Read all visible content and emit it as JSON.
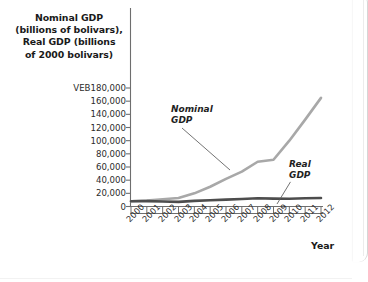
{
  "figure": {
    "y_axis_title_lines": [
      "Nominal GDP",
      "(billions of bolivars),",
      "Real GDP (billions",
      "of 2000 bolivars)"
    ],
    "x_axis_title": "Year",
    "annotations": {
      "nominal_line1": "Nominal",
      "nominal_line2": "GDP",
      "real_line1": "Real",
      "real_line2": "GDP"
    },
    "colors": {
      "nominal_line": "#a8a8a8",
      "real_line": "#4d4d4d",
      "axis": "#6e6e6e",
      "text": "#1a1a1a",
      "background": "#ffffff"
    }
  },
  "chart_data": {
    "type": "line",
    "title": "",
    "subtitle": "",
    "xlabel": "Year",
    "ylabel": "Nominal GDP (billions of bolivars), Real GDP (billions of 2000 bolivars)",
    "x": [
      2000,
      2001,
      2002,
      2003,
      2004,
      2005,
      2006,
      2007,
      2008,
      2009,
      2010,
      2011,
      2012
    ],
    "categories": [
      "2000",
      "2001",
      "2002",
      "2003",
      "2004",
      "2005",
      "2006",
      "2007",
      "2008",
      "2009",
      "2010",
      "2011",
      "2012"
    ],
    "series": [
      {
        "name": "Nominal GDP",
        "color": "#a8a8a8",
        "values": [
          8000,
          9000,
          11000,
          13000,
          20000,
          30000,
          42000,
          53000,
          68000,
          71000,
          100000,
          132000,
          165000
        ]
      },
      {
        "name": "Real GDP",
        "color": "#4d4d4d",
        "values": [
          8000,
          8200,
          7500,
          7000,
          8500,
          9500,
          10500,
          11500,
          12500,
          12000,
          11800,
          12500,
          13000
        ]
      }
    ],
    "ylim": [
      0,
      180000
    ],
    "yticks": [
      0,
      20000,
      40000,
      60000,
      80000,
      100000,
      120000,
      140000,
      160000,
      180000
    ],
    "ytick_labels": [
      "0",
      "20,000",
      "40,000",
      "60,000",
      "80,000",
      "100,000",
      "120,000",
      "140,000",
      "160,000",
      "VEB180,000"
    ],
    "xlim": [
      2000,
      2012
    ],
    "currency_prefix": "VEB",
    "grid": false,
    "legend": "annotations-inline",
    "legend_position": "inline-labels"
  }
}
